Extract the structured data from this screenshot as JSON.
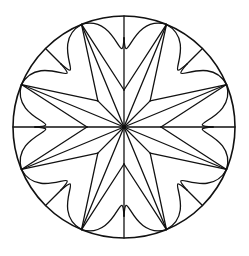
{
  "figure": {
    "kind": "eight-point star rosette in circle",
    "center": [
      124,
      127
    ],
    "outer_radius": 111,
    "notch_radius": 89,
    "valley_radius": 37,
    "point_count": 8,
    "tip_offset_deg": 22.5,
    "stroke_color": "#111111",
    "background_color": "#ffffff"
  }
}
